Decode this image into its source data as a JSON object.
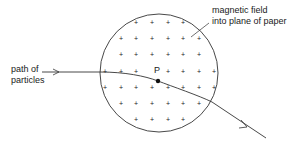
{
  "diagram": {
    "labels": {
      "field_line1": "magnetic field",
      "field_line2": "into plane of paper",
      "path_line1": "path of",
      "path_line2": "particles",
      "point": "P"
    },
    "colors": {
      "stroke": "#333333",
      "text": "#1a1a1a",
      "background": "#ffffff"
    },
    "circle": {
      "cx": 159,
      "cy": 73,
      "r": 59
    },
    "field_symbol": "+",
    "field_rows": [
      {
        "y": 22,
        "xs": [
          136,
          152,
          168,
          183
        ]
      },
      {
        "y": 38,
        "xs": [
          121,
          136,
          152,
          168,
          183,
          199
        ]
      },
      {
        "y": 54,
        "xs": [
          121,
          136,
          152,
          168,
          183,
          199
        ]
      },
      {
        "y": 71,
        "xs": [
          105,
          121,
          136,
          168,
          183,
          199,
          214
        ]
      },
      {
        "y": 87,
        "xs": [
          105,
          121,
          136,
          152,
          168,
          183,
          199,
          214
        ]
      },
      {
        "y": 103,
        "xs": [
          121,
          136,
          152,
          168,
          183,
          199
        ]
      },
      {
        "y": 119,
        "xs": [
          136,
          152,
          168,
          183
        ]
      }
    ],
    "point_p": {
      "x": 158,
      "y": 81
    }
  }
}
